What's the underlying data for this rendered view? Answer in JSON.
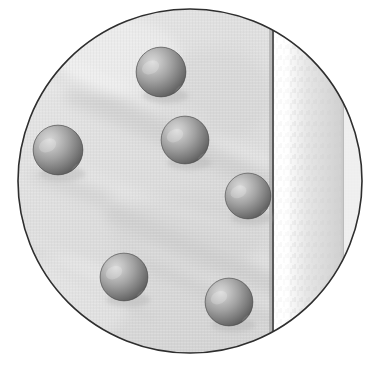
{
  "figure": {
    "title": "Circular cropped photograph of spheres on fabric",
    "canvas": {
      "width": 380,
      "height": 366,
      "background": "#ffffff"
    },
    "frame": {
      "shape": "circle",
      "name": "circular-vignette-frame",
      "center_x": 190,
      "center_y": 181,
      "radius": 172,
      "border_color": "#2e2e2e",
      "border_width": 1.6
    },
    "background_surface": {
      "description": "light gray fabric with soft diagonal creases",
      "base_color": "#d9d9d9",
      "light_color": "#ececec",
      "shadow_color": "#c2c2c2",
      "crease_color": "#bdbdbd",
      "crease_angle_deg": 28
    },
    "vertical_seam": {
      "name": "dark-seam-line",
      "x": 273,
      "color": "#5a5a5a",
      "width": 2
    },
    "bright_band": {
      "name": "bright-vertical-band",
      "x_start": 274,
      "x_end": 343,
      "highlight_color": "#fbfbfb",
      "mottle_color": "#dcdcdc",
      "edge_color": "#c8c8c8"
    },
    "band_edge_line": {
      "name": "band-edge-line",
      "x": 343,
      "color": "#bcbcbc",
      "width": 1
    },
    "sphere_style": {
      "highlight_color": "#d5d5d5",
      "mid_color": "#9a9a9a",
      "dark_color": "#5e5e5e",
      "rim_color": "#4a4a4a",
      "shadow_color": "#b0b0b0",
      "highlight_offset_x_pct": 33,
      "highlight_offset_y_pct": 30
    },
    "spheres": [
      {
        "id": "sphere-top-center",
        "label": "Sphere 1",
        "cx": 161,
        "cy": 72,
        "r": 25
      },
      {
        "id": "sphere-mid-center",
        "label": "Sphere 2",
        "cx": 185,
        "cy": 140,
        "r": 24
      },
      {
        "id": "sphere-left",
        "label": "Sphere 3",
        "cx": 58,
        "cy": 150,
        "r": 25
      },
      {
        "id": "sphere-right",
        "label": "Sphere 4",
        "cx": 248,
        "cy": 196,
        "r": 23
      },
      {
        "id": "sphere-bottom-left",
        "label": "Sphere 5",
        "cx": 124,
        "cy": 277,
        "r": 24
      },
      {
        "id": "sphere-bottom-right",
        "label": "Sphere 6",
        "cx": 229,
        "cy": 302,
        "r": 24
      }
    ],
    "sphere_count": 6,
    "creases": [
      {
        "x1": 20,
        "y1": 60,
        "x2": 200,
        "y2": 135,
        "w": 16,
        "op": 0.45
      },
      {
        "x1": 75,
        "y1": 95,
        "x2": 265,
        "y2": 180,
        "w": 22,
        "op": 0.4
      },
      {
        "x1": 40,
        "y1": 175,
        "x2": 245,
        "y2": 250,
        "w": 18,
        "op": 0.32
      },
      {
        "x1": 115,
        "y1": 215,
        "x2": 280,
        "y2": 285,
        "w": 20,
        "op": 0.38
      },
      {
        "x1": 150,
        "y1": 265,
        "x2": 275,
        "y2": 320,
        "w": 14,
        "op": 0.3
      },
      {
        "x1": 30,
        "y1": 250,
        "x2": 150,
        "y2": 315,
        "w": 12,
        "op": 0.22
      }
    ]
  }
}
